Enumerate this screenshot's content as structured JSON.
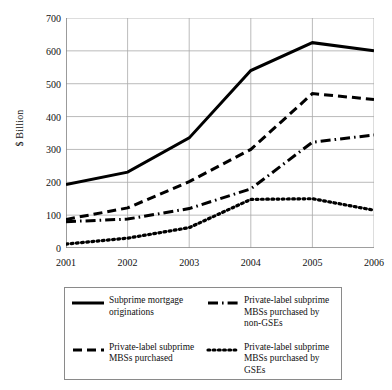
{
  "chart_data": {
    "type": "line",
    "title": "",
    "xlabel": "",
    "ylabel": "$ Billion",
    "categories": [
      "2001",
      "2002",
      "2003",
      "2004",
      "2005",
      "2006"
    ],
    "x": [
      2001,
      2002,
      2003,
      2004,
      2005,
      2006
    ],
    "ylim": [
      0,
      700
    ],
    "yticks": [
      0,
      100,
      200,
      300,
      400,
      500,
      600,
      700
    ],
    "ytick_labels": [
      "0",
      "100",
      "200",
      "300",
      "400",
      "500",
      "600",
      "700"
    ],
    "grid": true,
    "legend_position": "below",
    "series": [
      {
        "name": "Subprime mortgage originations",
        "style": "solid",
        "color": "#000000",
        "values": [
          193,
          231,
          335,
          540,
          625,
          600
        ]
      },
      {
        "name": "Private-label subprime MBSs purchased",
        "style": "dashed",
        "color": "#000000",
        "values": [
          87,
          122,
          202,
          300,
          470,
          452
        ]
      },
      {
        "name": "Private-label subprime MBSs purchased by non-GSEs",
        "style": "dash-dot",
        "color": "#000000",
        "values": [
          80,
          88,
          120,
          180,
          322,
          344
        ]
      },
      {
        "name": "Private-label subprime MBSs purchased by GSEs",
        "style": "dotted",
        "color": "#000000",
        "values": [
          12,
          30,
          62,
          148,
          150,
          115
        ]
      }
    ]
  },
  "legend": {
    "entries": [
      {
        "label": "Subprime mortgage originations",
        "style": "solid"
      },
      {
        "label": "Private-label subprime MBSs purchased by non-GSEs",
        "style": "dash-dot"
      },
      {
        "label": "Private-label subprime MBSs purchased",
        "style": "dashed"
      },
      {
        "label": "Private-label subprime MBSs purchased by GSEs",
        "style": "dotted"
      }
    ]
  },
  "style": {
    "axis_color": "#7f7f7f",
    "grid_color": "#aaaaaa",
    "line_color": "#000000",
    "background": "#ffffff"
  }
}
